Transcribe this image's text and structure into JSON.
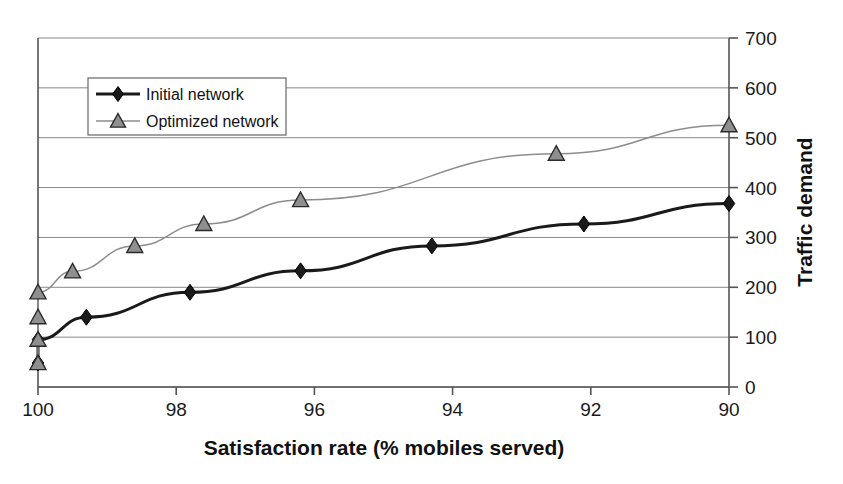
{
  "chart_data": {
    "type": "line",
    "title": "",
    "xlabel": "Satisfaction rate (% mobiles served)",
    "ylabel": "Traffic demand",
    "xlim": [
      100,
      90
    ],
    "ylim": [
      0,
      700
    ],
    "x_reversed": true,
    "xticks": [
      100,
      98,
      96,
      94,
      92,
      90
    ],
    "yticks": [
      0,
      100,
      200,
      300,
      400,
      500,
      600,
      700
    ],
    "y_axis_position": "right",
    "grid": "horizontal",
    "legend_position": "top-left-inside",
    "series": [
      {
        "name": "Initial network",
        "marker": "diamond",
        "color": "#1a1a1a",
        "line_width": 3,
        "points": [
          {
            "x": 100.0,
            "y": 48
          },
          {
            "x": 100.0,
            "y": 95
          },
          {
            "x": 99.3,
            "y": 140
          },
          {
            "x": 97.8,
            "y": 190
          },
          {
            "x": 96.2,
            "y": 233
          },
          {
            "x": 94.3,
            "y": 283
          },
          {
            "x": 92.1,
            "y": 327
          },
          {
            "x": 90.0,
            "y": 368
          }
        ]
      },
      {
        "name": "Optimized network",
        "marker": "triangle",
        "color": "#8c8c8c",
        "line_width": 1.5,
        "points": [
          {
            "x": 100.0,
            "y": 48
          },
          {
            "x": 100.0,
            "y": 95
          },
          {
            "x": 100.0,
            "y": 140
          },
          {
            "x": 100.0,
            "y": 190
          },
          {
            "x": 99.5,
            "y": 232
          },
          {
            "x": 98.6,
            "y": 283
          },
          {
            "x": 97.6,
            "y": 327
          },
          {
            "x": 96.2,
            "y": 375
          },
          {
            "x": 92.5,
            "y": 468
          },
          {
            "x": 90.0,
            "y": 525
          }
        ]
      }
    ]
  },
  "xtick_labels": [
    "100",
    "98",
    "96",
    "94",
    "92",
    "90"
  ],
  "ytick_labels": [
    "0",
    "100",
    "200",
    "300",
    "400",
    "500",
    "600",
    "700"
  ],
  "legend": {
    "items": [
      {
        "label": "Initial network",
        "marker": "diamond-icon"
      },
      {
        "label": "Optimized network",
        "marker": "triangle-icon"
      }
    ]
  },
  "axes": {
    "x_title": "Satisfaction rate (% mobiles served)",
    "y_title": "Traffic demand"
  },
  "colors": {
    "initial_series": "#1a1a1a",
    "optimized_series": "#8c8c8c",
    "grid": "#888888",
    "axis": "#555555",
    "background": "#ffffff"
  },
  "caption_fragment": ""
}
